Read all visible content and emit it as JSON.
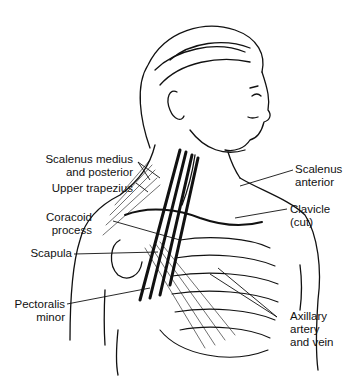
{
  "figure": {
    "labels": {
      "scalenus_medius_line1": "Scalenus medius",
      "scalenus_medius_line2": "and posterior",
      "upper_trapezius": "Upper trapezius",
      "coracoid_line1": "Coracoid",
      "coracoid_line2": "process",
      "scapula": "Scapula",
      "pectoralis_line1": "Pectoralis",
      "pectoralis_line2": "minor",
      "scalenus_anterior_line1": "Scalenus",
      "scalenus_anterior_line2": "anterior",
      "clavicle_line1": "Clavicle",
      "clavicle_line2": "(cut)",
      "axillary_line1": "Axillary",
      "axillary_line2": "artery",
      "axillary_line3": "and vein"
    },
    "colors": {
      "ink": "#111111",
      "background": "#ffffff"
    }
  }
}
